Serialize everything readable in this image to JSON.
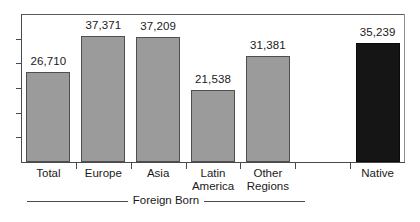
{
  "chart_data": {
    "type": "bar",
    "title": "",
    "subtitle": "",
    "xlabel": "",
    "ylabel": "",
    "categories": [
      "Total",
      "Europe",
      "Asia",
      "Latin America",
      "Other Regions",
      "Native"
    ],
    "category_lines": [
      [
        "Total"
      ],
      [
        "Europe"
      ],
      [
        "Asia"
      ],
      [
        "Latin",
        "America"
      ],
      [
        "Other",
        "Regions"
      ],
      [
        "Native"
      ]
    ],
    "values": [
      26710,
      37371,
      37209,
      21538,
      31381,
      35239
    ],
    "value_labels": [
      "26,710",
      "37,371",
      "37,209",
      "21,538",
      "31,381",
      "35,239"
    ],
    "bar_colors": [
      "#9b9b9b",
      "#9b9b9b",
      "#9b9b9b",
      "#9b9b9b",
      "#9b9b9b",
      "#151515"
    ],
    "ylim": [
      0,
      44000
    ],
    "grid": false,
    "legend": "none",
    "y_tick_count": 5,
    "y_tick_labels": [],
    "group_bracket": {
      "label": "Foreign Born",
      "covers": [
        "Total",
        "Europe",
        "Asia",
        "Latin America",
        "Other Regions"
      ]
    }
  },
  "colors": {
    "bar_gray": "#9b9b9b",
    "bar_dark": "#151515",
    "axis": "#4a4a4a",
    "text": "#1a1a1a",
    "background": "#ffffff"
  }
}
